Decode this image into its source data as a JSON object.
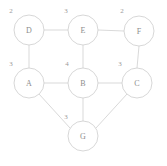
{
  "diagram": {
    "background_color": "#ffffff",
    "edge_color": "#cfcfcf",
    "node_fill": "#ffffff",
    "node_stroke": "#cdcdcd",
    "label_color": "#8d8d8d",
    "badge_color": "#9a9a9a",
    "node_radius": 15,
    "nodes": [
      {
        "id": "D",
        "label": "D",
        "badge": "2",
        "cx": 29,
        "cy": 30,
        "badge_x": 11,
        "badge_y": 11
      },
      {
        "id": "E",
        "label": "E",
        "badge": "3",
        "cx": 83,
        "cy": 30,
        "badge_x": 66,
        "badge_y": 11
      },
      {
        "id": "F",
        "label": "F",
        "badge": "2",
        "cx": 139,
        "cy": 31,
        "badge_x": 122,
        "badge_y": 11
      },
      {
        "id": "A",
        "label": "A",
        "badge": "3",
        "cx": 29,
        "cy": 83,
        "badge_x": 11,
        "badge_y": 64
      },
      {
        "id": "B",
        "label": "B",
        "badge": "4",
        "cx": 83,
        "cy": 83,
        "badge_x": 67,
        "badge_y": 64
      },
      {
        "id": "C",
        "label": "C",
        "badge": "3",
        "cx": 137,
        "cy": 83,
        "badge_x": 120,
        "badge_y": 64
      },
      {
        "id": "G",
        "label": "G",
        "badge": "3",
        "cx": 83,
        "cy": 136,
        "badge_x": 66,
        "badge_y": 117
      }
    ],
    "edges": [
      {
        "from": "D",
        "to": "E",
        "x1": 44,
        "y1": 30,
        "x2": 68,
        "y2": 30
      },
      {
        "from": "E",
        "to": "F",
        "x1": 98,
        "y1": 30,
        "x2": 124,
        "y2": 31
      },
      {
        "from": "D",
        "to": "A",
        "x1": 29,
        "y1": 45,
        "x2": 29,
        "y2": 68
      },
      {
        "from": "E",
        "to": "B",
        "x1": 83,
        "y1": 45,
        "x2": 83,
        "y2": 68
      },
      {
        "from": "F",
        "to": "C",
        "x1": 139,
        "y1": 46,
        "x2": 137,
        "y2": 68
      },
      {
        "from": "A",
        "to": "B",
        "x1": 44,
        "y1": 83,
        "x2": 68,
        "y2": 83
      },
      {
        "from": "B",
        "to": "C",
        "x1": 98,
        "y1": 83,
        "x2": 122,
        "y2": 83
      },
      {
        "from": "A",
        "to": "G",
        "x1": 39,
        "y1": 94,
        "x2": 70,
        "y2": 128
      },
      {
        "from": "B",
        "to": "G",
        "x1": 83,
        "y1": 98,
        "x2": 83,
        "y2": 121
      },
      {
        "from": "C",
        "to": "G",
        "x1": 127,
        "y1": 94,
        "x2": 96,
        "y2": 128
      }
    ]
  }
}
